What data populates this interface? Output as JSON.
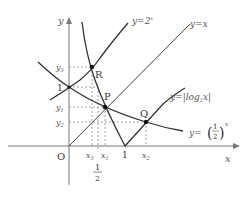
{
  "diagram": {
    "axes": {
      "x_label": "x",
      "y_label": "y",
      "origin_label": "O"
    },
    "curves": [
      {
        "id": "exp2",
        "label": "y=2",
        "exponent": "x"
      },
      {
        "id": "identity",
        "label": "y=x"
      },
      {
        "id": "abslog",
        "label": "y=|log",
        "sub": "2",
        "tail": "x|"
      },
      {
        "id": "half_exp",
        "label": "y=",
        "frac_num": "1",
        "frac_den": "2",
        "exponent": "x"
      }
    ],
    "points": [
      {
        "name": "R"
      },
      {
        "name": "P"
      },
      {
        "name": "Q"
      }
    ],
    "y_ticks": [
      "y",
      "1",
      "y",
      "y"
    ],
    "y_tick_subs": [
      "3",
      "",
      "1",
      "2"
    ],
    "x_ticks": [
      "x",
      "x",
      "1",
      "x"
    ],
    "x_tick_subs": [
      "3",
      "1",
      "",
      "2"
    ],
    "half_label": {
      "num": "1",
      "den": "2"
    }
  }
}
